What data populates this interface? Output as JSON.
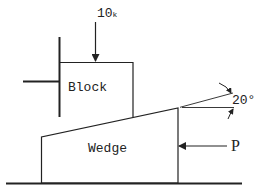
{
  "diagram": {
    "type": "statics-wedge-problem",
    "labels": {
      "block": "Block",
      "wedge": "Wedge",
      "load": "10",
      "load_unit": "k",
      "push_force": "P",
      "angle": "20°"
    },
    "colors": {
      "stroke": "#222222",
      "background": "#ffffff"
    }
  }
}
